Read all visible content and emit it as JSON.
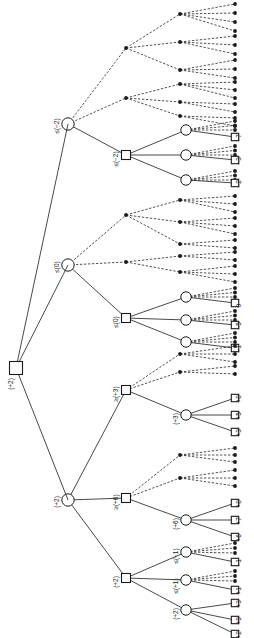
{
  "figure": {
    "orientation": "rotated-90",
    "background_color": "#ffffff",
    "stroke_color": "#1a1a1a",
    "solid_edge_meaning": "explored branch",
    "dashed_edge_meaning": "pruned / cut-off branch"
  },
  "legend": {
    "square_node": "MAX node (square)",
    "circle_node": "MIN node (circle)",
    "dot_node": "pruned leaf (filled dot)"
  },
  "chart_data": {
    "type": "tree",
    "root": {
      "label": "(+2)",
      "shape": "square"
    },
    "levels": [
      {
        "depth": 1,
        "shape": "circle",
        "nodes": [
          {
            "label": "≤(−2)"
          },
          {
            "label": "≤(0)"
          },
          {
            "label": "(+2)"
          }
        ]
      },
      {
        "depth": 2,
        "shape": "square",
        "nodes": [
          {
            "label": "≤(−2)"
          },
          {
            "label": "≤(0)"
          },
          {
            "label": "≥(+3)"
          },
          {
            "label": "≥(+6)"
          },
          {
            "label": "(+2)"
          }
        ]
      },
      {
        "depth": 3,
        "shape": "circle",
        "nodes": [
          {
            "label": "(+3)"
          },
          {
            "label": "(+6)"
          },
          {
            "label": "≤(−1)"
          },
          {
            "label": "≤(+1)"
          },
          {
            "label": "(+2)"
          }
        ]
      }
    ],
    "leaf_values": [
      "−7",
      "−3",
      "−2",
      "0",
      "−5",
      "−1",
      "+8",
      "+5",
      "+3",
      "+8",
      "+7",
      "+6",
      "−1",
      "+1",
      "+3",
      "+9",
      "+2"
    ],
    "leaf_labels_top_group": [
      "−7",
      "−3",
      "−2"
    ],
    "leaf_labels_mid_group": [
      "0",
      "−5",
      "−1"
    ],
    "leaf_labels_plus3_group": [
      "+8",
      "+5",
      "+3"
    ],
    "leaf_labels_plus6_group": [
      "+8",
      "+7",
      "+6"
    ],
    "leaf_labels_minus1_group": [
      "−1"
    ],
    "leaf_labels_plus1_group": [
      "+1"
    ],
    "leaf_labels_plus2_group": [
      "+3",
      "+9",
      "+2"
    ]
  },
  "nodes": {
    "root": "(+2)",
    "l1_a": "≤(−2)",
    "l1_b": "≤(0)",
    "l1_c": "(+2)",
    "l2_a": "≤(−2)",
    "l2_b": "≤(0)",
    "l2_c": "≥(+3)",
    "l2_d": "≥(+6)",
    "l2_e": "(+2)",
    "l3_a": "(+3)",
    "l3_b": "(+6)",
    "l3_c": "≤(−1)",
    "l3_d": "≤(+1)",
    "l3_e": "(+2)"
  },
  "leaves": {
    "t1": "−7",
    "t2": "−3",
    "t3": "−2",
    "m1": "0",
    "m2": "−5",
    "m3": "−1",
    "p3a": "+8",
    "p3b": "+5",
    "p3c": "+3",
    "p6a": "+8",
    "p6b": "+7",
    "p6c": "+6",
    "n1a": "−1",
    "n1b": "+1",
    "p2a": "+3",
    "p2b": "+9",
    "p2c": "+2"
  }
}
